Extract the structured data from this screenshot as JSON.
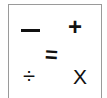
{
  "icon": {
    "description": "math operators icon",
    "minus": "—",
    "plus": "+",
    "equals": "=",
    "divide": "÷",
    "multiply": "X",
    "colors": {
      "symbol": "#111111",
      "border": "#9a9a9a",
      "background": "#ffffff"
    }
  }
}
